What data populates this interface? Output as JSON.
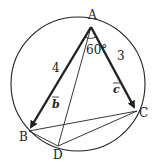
{
  "diagram": {
    "type": "geometry",
    "points": {
      "A": {
        "label": "A",
        "x": 91,
        "y": 27
      },
      "B": {
        "label": "B",
        "x": 29,
        "y": 131
      },
      "C": {
        "label": "C",
        "x": 137,
        "y": 111
      },
      "D": {
        "label": "D",
        "x": 58,
        "y": 146
      }
    },
    "circle": {
      "cx": 78,
      "cy": 84,
      "r": 67
    },
    "angle_label": "60°",
    "length_AB": "4",
    "length_AC": "3",
    "vector_b": "b",
    "vector_c": "c",
    "line_color": "#222222"
  }
}
